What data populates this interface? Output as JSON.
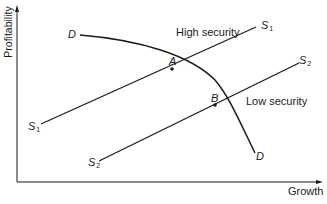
{
  "diagram": {
    "type": "economics-curve-diagram",
    "axes": {
      "y_label": "Profitability",
      "x_label": "Growth"
    },
    "curves": {
      "demand": {
        "start_label": "D",
        "end_label": "D"
      },
      "s1": {
        "start_label": "S",
        "start_sub": "1",
        "end_label": "S",
        "end_sub": "1",
        "annotation": "High security"
      },
      "s2": {
        "start_label": "S",
        "start_sub": "2",
        "end_label": "S",
        "end_sub": "2",
        "annotation": "Low security"
      }
    },
    "points": [
      {
        "label": "A",
        "description": "Intersection of D and S1"
      },
      {
        "label": "B",
        "description": "Intersection of D and S2"
      }
    ],
    "colors": {
      "line": "#1a1a1a",
      "background": "#ffffff"
    }
  }
}
